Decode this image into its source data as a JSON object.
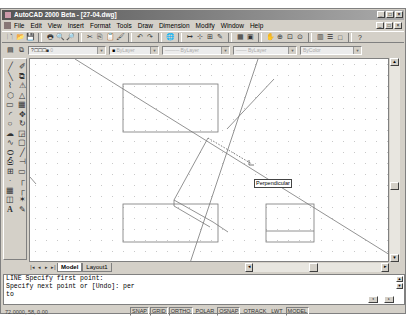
{
  "window": {
    "title": "AutoCAD 2000 Beta - [27-04.dwg]",
    "controls": [
      "_",
      "□",
      "×"
    ]
  },
  "menubar": {
    "items": [
      "File",
      "Edit",
      "View",
      "Insert",
      "Format",
      "Tools",
      "Draw",
      "Dimension",
      "Modify",
      "Window",
      "Help"
    ]
  },
  "standard_toolbar": {
    "icons": [
      "new-icon",
      "open-icon",
      "save-icon",
      "print-icon",
      "print-preview-icon",
      "find-icon",
      "cut-icon",
      "copy-icon",
      "paste-icon",
      "match-properties-icon",
      "undo-icon",
      "redo-icon",
      "internet-icon",
      "snap-from-icon",
      "osnap-icon",
      "ucs-icon",
      "distance-icon",
      "aerial-view-icon",
      "properties-icon",
      "pan-icon",
      "zoom-realtime-icon",
      "zoom-window-icon",
      "zoom-previous-icon",
      "design-center-icon",
      "layer-properties-icon",
      "block-icon",
      "help-icon"
    ],
    "glyphs": [
      "🗋",
      "📂",
      "💾",
      "🖶",
      "🔍",
      "🔎",
      "✂",
      "⎘",
      "📋",
      "🖌",
      "↶",
      "↷",
      "🌐",
      "↦",
      "⊹",
      "⊞",
      "✎",
      "▦",
      "▣",
      "✋",
      "⊕",
      "⊡",
      "⊙",
      "▥",
      "☰",
      "□",
      "?"
    ]
  },
  "properties_bar": {
    "layer_value": "0",
    "color_value": "ByLayer",
    "linetype_value": "ByLayer",
    "lineweight_value": "ByLayer",
    "plotstyle_value": "ByColor"
  },
  "draw_toolbar": {
    "icons": [
      "line",
      "construction-line",
      "polyline",
      "polygon",
      "rectangle",
      "arc",
      "circle",
      "revision-cloud",
      "spline",
      "ellipse",
      "insert-block",
      "make-block",
      "point",
      "hatch",
      "region",
      "multiline-text"
    ],
    "glyphs": [
      "╱",
      "╲",
      "⌇",
      "⬡",
      "▭",
      "◜",
      "○",
      "☁",
      "∿",
      "⬭",
      "⎙",
      "⊞",
      "·",
      "▦",
      "◫",
      "A"
    ]
  },
  "modify_toolbar": {
    "icons": [
      "erase",
      "copy",
      "mirror",
      "offset",
      "array",
      "move",
      "rotate",
      "scale",
      "stretch",
      "trim",
      "extend",
      "break",
      "chamfer",
      "fillet",
      "explode",
      "edit"
    ],
    "glyphs": [
      "✐",
      "⧉",
      "⚠",
      "△",
      "▦",
      "✥",
      "↻",
      "◲",
      "▢",
      "╱",
      "⊣",
      "▭",
      "┌",
      "┌",
      "✶",
      "✎"
    ]
  },
  "canvas": {
    "tooltip": "Perpendicular",
    "dot_grid": true
  },
  "layout_tabs": {
    "nav": [
      "|◂",
      "◂",
      "▸",
      "▸|"
    ],
    "tabs": [
      {
        "label": "Model",
        "active": true
      },
      {
        "label": "Layout1",
        "active": false
      }
    ]
  },
  "command_line": {
    "lines": [
      "LINE Specify first point:",
      "Specify next point or [Undo]: per",
      "to"
    ]
  },
  "status_bar": {
    "coordinates": "72.0000, 58, 0.00",
    "toggles": [
      {
        "label": "SNAP",
        "on": true
      },
      {
        "label": "GRID",
        "on": true
      },
      {
        "label": "ORTHO",
        "on": true
      },
      {
        "label": "POLAR",
        "on": false
      },
      {
        "label": "OSNAP",
        "on": true
      },
      {
        "label": "OTRACK",
        "on": false
      },
      {
        "label": "LWT",
        "on": false
      },
      {
        "label": "MODEL",
        "on": true
      }
    ]
  }
}
